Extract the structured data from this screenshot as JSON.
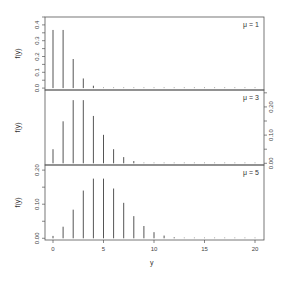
{
  "chart_data": {
    "type": "bar",
    "title": "",
    "xlabel": "y",
    "ylabel": "f(y)",
    "x": [
      0,
      1,
      2,
      3,
      4,
      5,
      6,
      7,
      8,
      9,
      10,
      11,
      12,
      13,
      14,
      15,
      16,
      17,
      18,
      19,
      20
    ],
    "xticks": [
      0,
      5,
      10,
      15,
      20
    ],
    "xlim": [
      -0.8,
      21
    ],
    "grid": false,
    "panels": [
      {
        "label": "μ = 1",
        "yaxis_side": "left",
        "ylim": [
          -0.012,
          0.45
        ],
        "yticks": [
          0.0,
          0.1,
          0.2,
          0.3,
          0.4
        ],
        "ytick_labels": [
          "0.0",
          "0.1",
          "0.2",
          "0.3",
          "0.4"
        ],
        "values": [
          0.368,
          0.368,
          0.184,
          0.061,
          0.015,
          0.003,
          0.0005,
          0.0001,
          0,
          0,
          0,
          0,
          0,
          0,
          0,
          0,
          0,
          0,
          0,
          0,
          0
        ]
      },
      {
        "label": "μ = 3",
        "yaxis_side": "right",
        "ylim": [
          -0.006,
          0.26
        ],
        "yticks": [
          0.0,
          0.1,
          0.2
        ],
        "ytick_labels": [
          "0.00",
          "0.10",
          "0.20"
        ],
        "values": [
          0.05,
          0.149,
          0.224,
          0.224,
          0.168,
          0.101,
          0.05,
          0.022,
          0.008,
          0.003,
          0.001,
          0.0003,
          0.0001,
          0,
          0,
          0,
          0,
          0,
          0,
          0,
          0
        ]
      },
      {
        "label": "μ = 5",
        "yaxis_side": "left",
        "ylim": [
          -0.005,
          0.215
        ],
        "yticks": [
          0.0,
          0.1,
          0.2
        ],
        "ytick_labels": [
          "0.00",
          "0.10",
          "0.20"
        ],
        "values": [
          0.007,
          0.034,
          0.084,
          0.14,
          0.175,
          0.175,
          0.146,
          0.104,
          0.065,
          0.036,
          0.018,
          0.008,
          0.003,
          0.001,
          0.0005,
          0.0002,
          0,
          0,
          0,
          0,
          0
        ]
      }
    ]
  }
}
